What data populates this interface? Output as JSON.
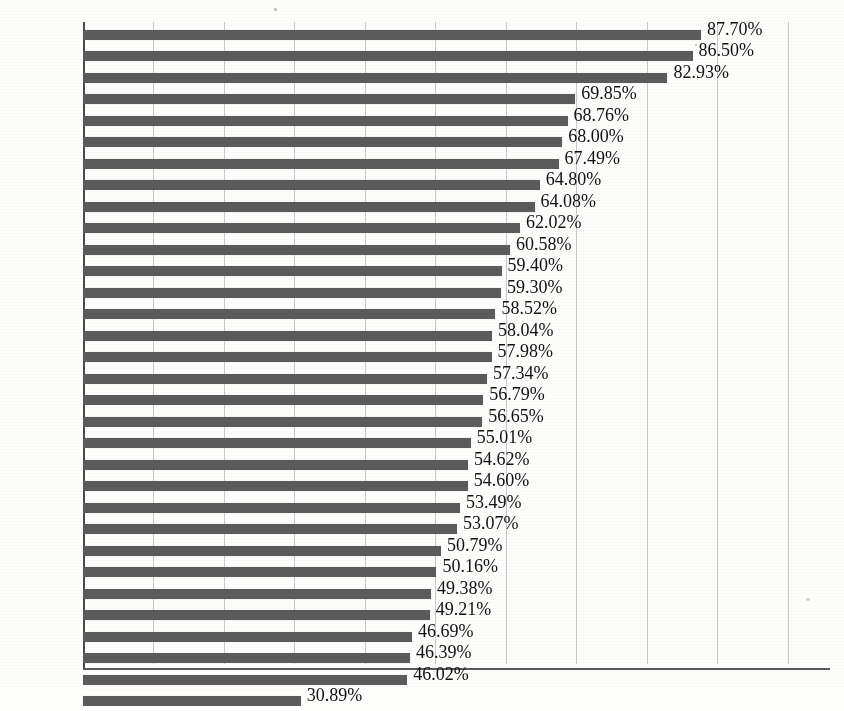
{
  "chart_data": {
    "type": "bar",
    "orientation": "horizontal",
    "title": "",
    "subtitle": "",
    "xlabel": "",
    "ylabel": "",
    "unit": "%",
    "value_suffix": "%",
    "grid": true,
    "grid_axis": "x",
    "legend": "none",
    "xlim": [
      0,
      106
    ],
    "x_tick_labels": [],
    "x_gridline_values": [
      10,
      20,
      30,
      40,
      50,
      60,
      70,
      80,
      90,
      100
    ],
    "categories": [
      "上海",
      "北京",
      "天津",
      "广东",
      "江苏",
      "浙江",
      "辽宁",
      "福建",
      "重庆",
      "内蒙古",
      "山东",
      "黑龙江",
      "湖北",
      "全国",
      "海南",
      "宁夏",
      "山西",
      "陕西",
      "吉林",
      "河北",
      "湖南",
      "江西",
      "安徽",
      "青海",
      "四川",
      "河南",
      "新疆",
      "广西",
      "云南",
      "甘肃",
      "贵州",
      "西藏"
    ],
    "values": [
      87.7,
      86.5,
      82.93,
      69.85,
      68.76,
      68.0,
      67.49,
      64.8,
      64.08,
      62.02,
      60.58,
      59.4,
      59.3,
      58.52,
      58.04,
      57.98,
      57.34,
      56.79,
      56.65,
      55.01,
      54.62,
      54.6,
      53.49,
      53.07,
      50.79,
      50.16,
      49.38,
      49.21,
      46.69,
      46.39,
      46.02,
      30.89
    ],
    "value_labels": [
      "87.70%",
      "86.50%",
      "82.93%",
      "69.85%",
      "68.76%",
      "68.00%",
      "67.49%",
      "64.80%",
      "64.08%",
      "62.02%",
      "60.58%",
      "59.40%",
      "59.30%",
      "58.52%",
      "58.04%",
      "57.98%",
      "57.34%",
      "56.79%",
      "56.65%",
      "55.01%",
      "54.62%",
      "54.60%",
      "53.49%",
      "53.07%",
      "50.79%",
      "50.16%",
      "49.38%",
      "49.21%",
      "46.69%",
      "46.39%",
      "46.02%",
      "30.89%"
    ],
    "colors": {
      "bar": "#5b5b5b",
      "gridline": "#c9c9c9",
      "axis": "#4a4a4a",
      "label_text": "#1a1a1a",
      "value_text": "#111111",
      "background": "#fdfdfc"
    }
  }
}
